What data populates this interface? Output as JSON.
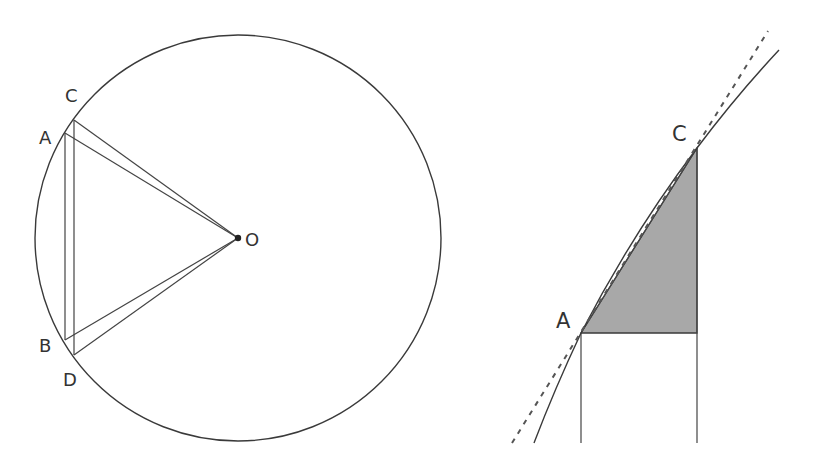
{
  "colors": {
    "stroke": "#3a3a3a",
    "fill_shaded": "#a8a8a8",
    "background": "#ffffff"
  },
  "left_figure": {
    "description": "Circle with center O and two thin isoceles triangles OAB and OCD inscribed",
    "circle": {
      "cx": 238,
      "cy": 238,
      "r": 203
    },
    "points": {
      "C": {
        "label": "C",
        "x": 74,
        "y": 120
      },
      "A": {
        "label": "A",
        "x": 65,
        "y": 133
      },
      "B": {
        "label": "B",
        "x": 65,
        "y": 340
      },
      "D": {
        "label": "D",
        "x": 73,
        "y": 355
      },
      "O": {
        "label": "O",
        "x": 238,
        "y": 238
      }
    },
    "labels": {
      "C": "C",
      "A": "A",
      "B": "B",
      "D": "D",
      "O": "O"
    }
  },
  "right_figure": {
    "description": "Zoomed view of arc AC with chord AC, tangent line (dashed), and shaded right triangle under chord",
    "points": {
      "A": {
        "label": "A",
        "x": 581,
        "y": 333
      },
      "C": {
        "label": "C",
        "x": 697,
        "y": 148
      }
    },
    "labels": {
      "A": "A",
      "C": "C"
    },
    "tangent_line": {
      "x1": 512,
      "y1": 443,
      "x2": 768,
      "y2": 31,
      "style": "dashed"
    },
    "curve": {
      "start": [
        534,
        443
      ],
      "end": [
        779,
        50
      ]
    },
    "verticals_bottom_y": 443
  }
}
